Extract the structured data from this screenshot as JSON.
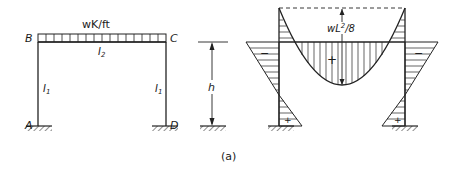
{
  "frame": {
    "load_label": "wK/ft",
    "joints": {
      "top_left": "B",
      "top_right": "C",
      "bottom_left": "A",
      "bottom_right": "D"
    },
    "beam_inertia": "I",
    "beam_inertia_sub": "2",
    "column_inertia": "I",
    "column_inertia_sub": "1",
    "height_label": "h"
  },
  "moment_diagram": {
    "midspan_label": "wL",
    "midspan_label_sup": "2",
    "midspan_label_tail": "/8",
    "positive_sign": "+",
    "negative_sign": "−"
  },
  "caption": "(a)"
}
